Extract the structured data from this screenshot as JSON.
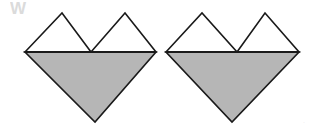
{
  "page": {
    "background_color": "#ffffff",
    "width": 316,
    "height": 130
  },
  "style": {
    "fill_color": "#b6b6b6",
    "white_fill": "#ffffff",
    "stroke_color": "#1a1a1a",
    "stroke_width": 1.6,
    "baseline_stroke_width": 2.0,
    "watermark_color": "#cfcfcf"
  },
  "watermark": {
    "label": "W",
    "x": 10,
    "y": 14
  },
  "corner_mark": {
    "label": "·",
    "x": 303,
    "y": 124
  },
  "figures": [
    {
      "name": "heart-figure-left",
      "baseline_y": 52,
      "left_x": 25,
      "right_x": 156,
      "bottom_apex": {
        "x": 95,
        "y": 122
      },
      "notch_x": 91,
      "lower_triangle": {
        "name": "lower-inverted-triangle",
        "points": "25,52 156,52 95,122",
        "fill": "#b6b6b6"
      },
      "upper_triangles": [
        {
          "name": "upper-left-triangle",
          "points": "25,52 62,13 91,52",
          "fill": "#ffffff"
        },
        {
          "name": "upper-right-triangle",
          "points": "91,52 125,13 156,52",
          "fill": "#ffffff"
        }
      ],
      "baseline": {
        "x1": 25,
        "y1": 52,
        "x2": 156,
        "y2": 52
      }
    },
    {
      "name": "heart-figure-right",
      "baseline_y": 52,
      "left_x": 166,
      "right_x": 299,
      "bottom_apex": {
        "x": 232,
        "y": 122
      },
      "notch_x": 237,
      "lower_triangle": {
        "name": "lower-inverted-triangle",
        "points": "166,52 299,52 232,122",
        "fill": "#b6b6b6"
      },
      "upper_triangles": [
        {
          "name": "upper-left-triangle",
          "points": "166,52 202,13 237,52",
          "fill": "#ffffff"
        },
        {
          "name": "upper-right-triangle",
          "points": "237,52 265,13 299,52",
          "fill": "#ffffff"
        }
      ],
      "baseline": {
        "x1": 166,
        "y1": 52,
        "x2": 299,
        "y2": 52
      }
    }
  ]
}
